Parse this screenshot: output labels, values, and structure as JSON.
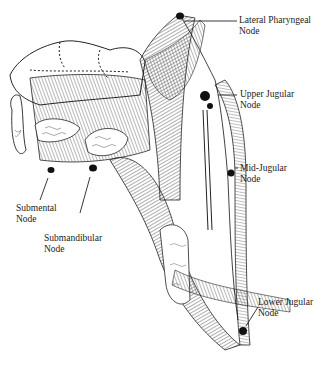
{
  "figure": {
    "labels": [
      {
        "id": "lateral-pharyngeal",
        "line1": "Lateral Pharyngeal",
        "line2": "Node"
      },
      {
        "id": "upper-jugular",
        "line1": "Upper Jugular",
        "line2": "Node"
      },
      {
        "id": "mid-jugular",
        "line1": "Mid-Jugular",
        "line2": "Node"
      },
      {
        "id": "submental",
        "line1": "Submental",
        "line2": "Node"
      },
      {
        "id": "submandibular",
        "line1": "Submandibular",
        "line2": "Node"
      },
      {
        "id": "lower-jugular",
        "line1": "Lower Jugular",
        "line2": "Node"
      }
    ]
  }
}
